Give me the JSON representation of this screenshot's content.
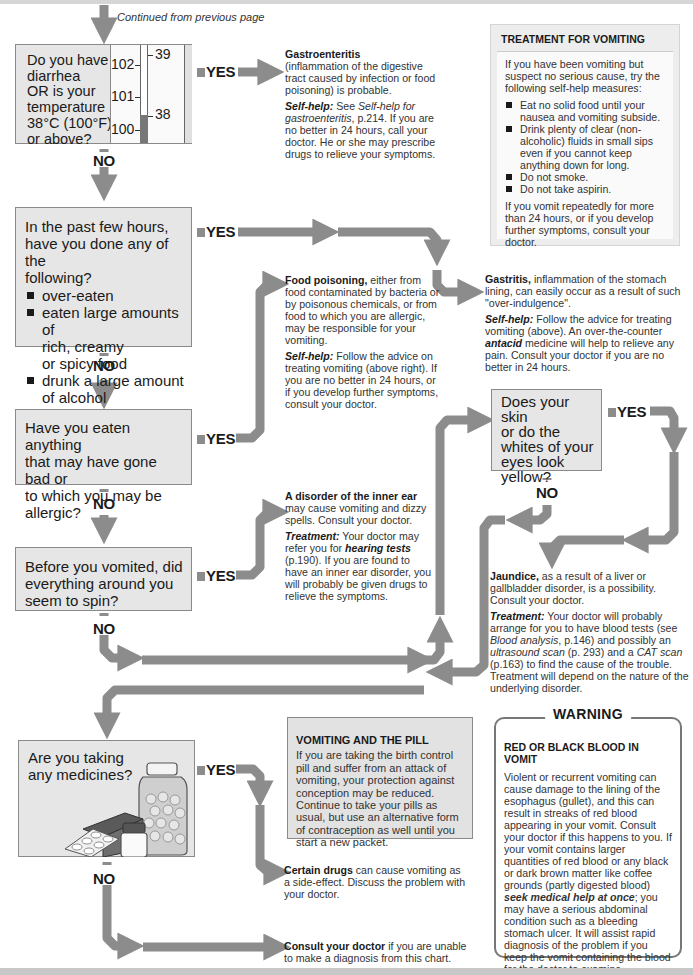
{
  "page": {
    "continued": "Continued from previous page",
    "colors": {
      "arrow": "#8c8c8c",
      "box_fill": "#e6e6e6",
      "box_border": "#8a8a8a",
      "text": "#1a1a1a"
    }
  },
  "questions": [
    {
      "id": "q1",
      "text": "Do you have diarrhea OR is your temperature 38°C (100°F) or above?",
      "lines": [
        "Do you have",
        "diarrhea",
        "OR is your",
        "temperature",
        "38°C (100°F)",
        "or above?"
      ],
      "yes": "YES",
      "no": "NO"
    },
    {
      "id": "q2",
      "lines": [
        "In the past few hours,",
        "have you done any of the",
        "following?"
      ],
      "items": [
        "over-eaten",
        "eaten large amounts of rich, creamy or spicy food",
        "drunk a large amount of alcohol"
      ],
      "items_lines": [
        [
          "over-eaten"
        ],
        [
          "eaten large amounts of",
          "rich, creamy",
          "or spicy food"
        ],
        [
          "drunk a large amount",
          "of alcohol"
        ]
      ],
      "yes": "YES",
      "no": "NO"
    },
    {
      "id": "q3",
      "lines": [
        "Have you eaten anything",
        "that may have gone bad or",
        "to which you may be",
        "allergic?"
      ],
      "yes": "YES",
      "no": "NO"
    },
    {
      "id": "q4",
      "lines": [
        "Before you vomited, did",
        "everything around you",
        "seem to spin?"
      ],
      "yes": "YES",
      "no": "NO"
    },
    {
      "id": "q5",
      "lines": [
        "Does your skin",
        "or do the",
        "whites of your",
        "eyes look",
        "yellow?"
      ],
      "yes": "YES",
      "no": "NO"
    },
    {
      "id": "q6",
      "lines": [
        "Are you taking",
        "any medicines?"
      ],
      "yes": "YES",
      "no": "NO",
      "illustration": "medicine-bottles-and-pill-blister-pack"
    }
  ],
  "thermometer": {
    "fahrenheit_ticks": [
      "102",
      "101",
      "100"
    ],
    "celsius_ticks": [
      "39",
      "38"
    ],
    "level_marker": "38"
  },
  "diagnoses": {
    "gastroenteritis": {
      "title": "Gastroenteritis",
      "body": "(inflammation of the digestive tract caused by infection or food poisoning) is probable.",
      "selfhelp_label": "Self-help:",
      "selfhelp_pre": " See ",
      "selfhelp_ref": "Self-help for gastroenteritis",
      "selfhelp_post": ", p.214. If you are no better in 24 hours, call your doctor. He or she may prescribe drugs to relieve your symptoms."
    },
    "gastritis": {
      "title": "Gastritis,",
      "body": " inflammation of the stomach lining, can easily occur as a result of such \"over-indulgence\".",
      "selfhelp_label": "Self-help:",
      "selfhelp_pre": " Follow the advice for treating vomiting (above). An over-the-counter ",
      "selfhelp_ref": "antacid",
      "selfhelp_post": " medicine will help to relieve any pain. Consult your doctor if you are no better in 24 hours."
    },
    "food_poisoning": {
      "title": "Food poisoning,",
      "body": " either from food contaminated by bacteria or by poisonous chemicals, or from food to which you are allergic, may be responsible for your vomiting.",
      "selfhelp_label": "Self-help:",
      "selfhelp_text": " Follow the advice on treating vomiting (above right). If you are no better in 24 hours, or if you develop further symptoms, consult your doctor."
    },
    "inner_ear": {
      "title": "A disorder of the inner ear",
      "body": " may cause vomiting and dizzy spells. Consult your doctor.",
      "treatment_label": "Treatment:",
      "treatment_pre": " Your doctor may refer you for ",
      "treatment_ref": "hearing tests",
      "treatment_post": " (p.190). If you are found to have an inner ear disorder, you will probably be given drugs to relieve the symptoms."
    },
    "jaundice": {
      "title": "Jaundice,",
      "body": " as a result of a liver or gallbladder disorder, is a possibility. Consult your doctor.",
      "treatment_label": "Treatment:",
      "t1": " Your doctor will probably arrange for you to have blood tests (see ",
      "ref1": "Blood analysis",
      "t2": ", p.146) and possibly an ",
      "ref2": "ultrasound scan",
      "t3": " (p. 293) and a ",
      "ref3": "CAT scan",
      "t4": " (p.163) to find the cause of the trouble. Treatment will depend on the nature of the underlying disorder."
    },
    "drugs": {
      "title": "Certain drugs",
      "body": " can cause vomiting as a side-effect. Discuss the problem with your doctor."
    },
    "consult": {
      "title": "Consult your doctor",
      "body": " if you are unable to make a diagnosis from this chart."
    }
  },
  "treatment_box": {
    "title": "TREATMENT FOR VOMITING",
    "intro": "If you have been vomiting but suspect no serious cause, try the following self-help measures:",
    "items": [
      "Eat no solid food until your nausea and vomiting subside.",
      "Drink plenty of clear (non-alcoholic) fluids in small sips even if you cannot keep anything down for long.",
      "Do not smoke.",
      "Do not take aspirin."
    ],
    "outro": "If you vomit repeatedly for more than 24 hours, or if you develop further symptoms, consult your doctor."
  },
  "pill_box": {
    "title": "VOMITING AND THE PILL",
    "body": "If you are taking the birth control pill and suffer from an attack of vomiting, your protection against conception may be reduced. Continue to take your pills as usual, but use an alternative form of contraception as well until you start a new packet."
  },
  "warning_box": {
    "banner": "WARNING",
    "title": "RED OR BLACK BLOOD IN VOMIT",
    "t1": "Violent or recurrent vomiting can cause damage to the lining of the esophagus (gullet), and this can result in streaks of red blood appearing in your vomit. Consult your doctor if this happens to you. If your vomit contains larger quantities of red blood or any black or dark brown matter like coffee grounds (partly digested blood) ",
    "emph": "seek medical help at once",
    "t2": "; you may have a serious abdominal condition such as a bleeding stomach ulcer. It will assist rapid diagnosis of the problem if you keep the vomit containing the blood for the doctor to examine."
  }
}
